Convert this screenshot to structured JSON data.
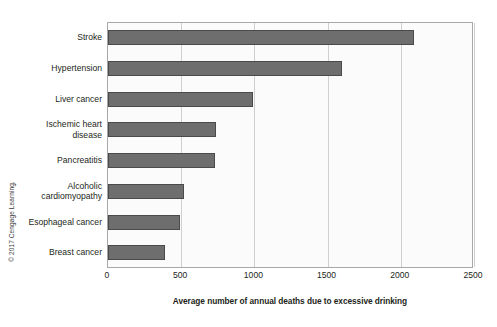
{
  "credit": "© 2017 Cengage Learning.",
  "axis": {
    "x_title": "Average number of annual deaths due to excessive drinking",
    "x_ticks": [
      "0",
      "500",
      "1000",
      "1500",
      "2000",
      "2500"
    ]
  },
  "colors": {
    "bar_fill": "#6e6e6e",
    "bar_stroke": "#4a4a4a",
    "grid": "#cfcfcf",
    "frame": "#a8a8a8",
    "plot_background": "#fbfbfb",
    "text": "#231f20"
  },
  "chart_data": {
    "type": "bar",
    "orientation": "horizontal",
    "title": "",
    "subtitle": "",
    "xlabel": "Average number of annual deaths due to excessive drinking",
    "ylabel": "",
    "xlim": [
      0,
      2500
    ],
    "xticks": [
      0,
      500,
      1000,
      1500,
      2000,
      2500
    ],
    "grid": true,
    "legend": false,
    "categories": [
      "Stroke",
      "Hypertension",
      "Liver cancer",
      "Ischemic heart disease",
      "Pancreatitis",
      "Alcoholic cardiomyopathy",
      "Esophageal cancer",
      "Breast cancer"
    ],
    "category_lines": [
      [
        "Stroke"
      ],
      [
        "Hypertension"
      ],
      [
        "Liver cancer"
      ],
      [
        "Ischemic heart",
        "disease"
      ],
      [
        "Pancreatitis"
      ],
      [
        "Alcoholic",
        "cardiomyopathy"
      ],
      [
        "Esophageal cancer"
      ],
      [
        "Breast cancer"
      ]
    ],
    "values": [
      2090,
      1600,
      990,
      740,
      730,
      520,
      490,
      390
    ],
    "annotations": [
      "© 2017 Cengage Learning."
    ]
  }
}
